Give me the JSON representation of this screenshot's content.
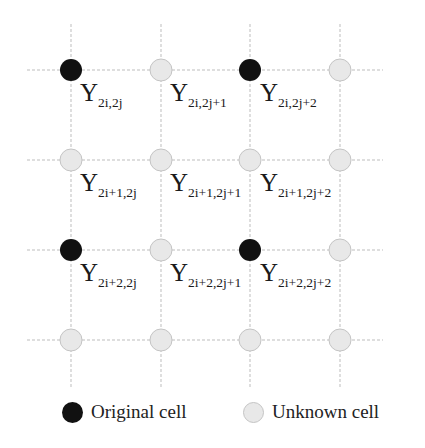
{
  "grid": {
    "columns_x": [
      71,
      161,
      250,
      340
    ],
    "rows_y": [
      70,
      160,
      250,
      340
    ],
    "h_line_span": [
      27,
      383
    ],
    "v_line_span": [
      24,
      388
    ],
    "line_color": "#bdbdbd",
    "node_radius": 11
  },
  "colors": {
    "original_fill": "#111111",
    "unknown_fill": "#e8e8e8",
    "unknown_stroke": "#c4c4c4"
  },
  "nodes": [
    [
      "original",
      "unknown",
      "original",
      "unknown"
    ],
    [
      "unknown",
      "unknown",
      "unknown",
      "unknown"
    ],
    [
      "original",
      "unknown",
      "original",
      "unknown"
    ],
    [
      "unknown",
      "unknown",
      "unknown",
      "unknown"
    ]
  ],
  "labels": [
    {
      "main": "Y",
      "sub": "2i,2j",
      "x": 80,
      "y": 80
    },
    {
      "main": "Y",
      "sub": "2i,2j+1",
      "x": 170,
      "y": 80
    },
    {
      "main": "Y",
      "sub": "2i,2j+2",
      "x": 260,
      "y": 80
    },
    {
      "main": "Y",
      "sub": "2i+1,2j",
      "x": 80,
      "y": 170
    },
    {
      "main": "Y",
      "sub": "2i+1,2j+1",
      "x": 170,
      "y": 170
    },
    {
      "main": "Y",
      "sub": "2i+1,2j+2",
      "x": 260,
      "y": 170
    },
    {
      "main": "Y",
      "sub": "2i+2,2j",
      "x": 80,
      "y": 260
    },
    {
      "main": "Y",
      "sub": "2i+2,2j+1",
      "x": 170,
      "y": 260
    },
    {
      "main": "Y",
      "sub": "2i+2,2j+2",
      "x": 260,
      "y": 260
    }
  ],
  "legend": {
    "original_label": "Original cell",
    "unknown_label": "Unknown cell"
  }
}
